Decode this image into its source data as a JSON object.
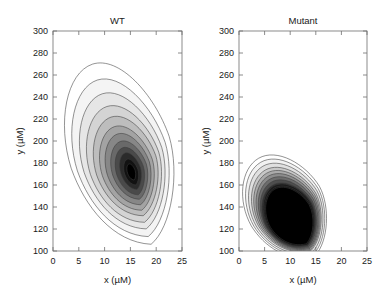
{
  "figure": {
    "background": "#ffffff",
    "width": 387,
    "height": 300
  },
  "chart_data": {
    "type": "contour",
    "title": "",
    "xlabel": "x (µM)",
    "ylabel": "y (µM)",
    "xlim": [
      0,
      25
    ],
    "ylim": [
      100,
      300
    ],
    "xticks": [
      0,
      5,
      10,
      15,
      20,
      25
    ],
    "yticks": [
      100,
      120,
      140,
      160,
      180,
      200,
      220,
      240,
      260,
      280,
      300
    ],
    "grid": false,
    "legend": "none",
    "colormap": "grayscale (white = low density, black = high density)",
    "panels": [
      {
        "name": "WT",
        "title": "WT",
        "description": "Broad nested teardrop-shaped density contours tilted up-right; light outer shells darkening toward a black core.",
        "peak": {
          "x": 15.2,
          "y": 172
        },
        "extent": {
          "x": [
            3.0,
            22.5
          ],
          "y": [
            108,
            276
          ]
        },
        "levels": [
          {
            "index": 1,
            "fill": "#ffffff",
            "label": "outermost"
          },
          {
            "index": 2,
            "fill": "#f2f2f2"
          },
          {
            "index": 3,
            "fill": "#e2e2e2"
          },
          {
            "index": 4,
            "fill": "#cfcfcf"
          },
          {
            "index": 5,
            "fill": "#b8b8b8"
          },
          {
            "index": 6,
            "fill": "#9e9e9e"
          },
          {
            "index": 7,
            "fill": "#828282"
          },
          {
            "index": 8,
            "fill": "#646464"
          },
          {
            "index": 9,
            "fill": "#454545"
          },
          {
            "index": 10,
            "fill": "#282828"
          },
          {
            "index": 11,
            "fill": "#101010"
          },
          {
            "index": 12,
            "fill": "#000000",
            "label": "innermost / peak"
          }
        ],
        "rings": [
          {
            "cx": 13.2,
            "cy": 190,
            "rx": 9.6,
            "ry": 84,
            "rot": -18,
            "fill": "#ffffff"
          },
          {
            "cx": 13.4,
            "cy": 186,
            "rx": 8.6,
            "ry": 73,
            "rot": -18,
            "fill": "#f4f4f4"
          },
          {
            "cx": 13.7,
            "cy": 183,
            "rx": 7.6,
            "ry": 63,
            "rot": -18,
            "fill": "#e6e6e6"
          },
          {
            "cx": 14.0,
            "cy": 180,
            "rx": 6.7,
            "ry": 54,
            "rot": -18,
            "fill": "#d4d4d4"
          },
          {
            "cx": 14.3,
            "cy": 178,
            "rx": 5.8,
            "ry": 46,
            "rot": -18,
            "fill": "#bdbdbd"
          },
          {
            "cx": 14.5,
            "cy": 176,
            "rx": 4.9,
            "ry": 39,
            "rot": -18,
            "fill": "#a3a3a3"
          },
          {
            "cx": 14.7,
            "cy": 175,
            "rx": 4.1,
            "ry": 33,
            "rot": -18,
            "fill": "#878787"
          },
          {
            "cx": 14.9,
            "cy": 174,
            "rx": 3.3,
            "ry": 27,
            "rot": -18,
            "fill": "#696969"
          },
          {
            "cx": 15.0,
            "cy": 173,
            "rx": 2.6,
            "ry": 22,
            "rot": -18,
            "fill": "#4a4a4a"
          },
          {
            "cx": 15.1,
            "cy": 173,
            "rx": 1.9,
            "ry": 17,
            "rot": -18,
            "fill": "#2b2b2b"
          },
          {
            "cx": 15.2,
            "cy": 172,
            "rx": 1.3,
            "ry": 12,
            "rot": -18,
            "fill": "#121212"
          },
          {
            "cx": 15.2,
            "cy": 172,
            "rx": 0.75,
            "ry": 7.5,
            "rot": -18,
            "fill": "#000000"
          }
        ]
      },
      {
        "name": "Mutant",
        "title": "Mutant",
        "description": "Compact, much denser blob concentrated at low x and low y; tightly spaced contours collapse quickly to a large solid black core.",
        "peak": {
          "x": 10.0,
          "y": 132
        },
        "extent": {
          "x": [
            2.2,
            17.0
          ],
          "y": [
            92,
            192
          ]
        },
        "levels": [
          {
            "index": 1,
            "fill": "#ffffff",
            "label": "outermost"
          },
          {
            "index": 2,
            "fill": "#f0f0f0"
          },
          {
            "index": 3,
            "fill": "#dcdcdc"
          },
          {
            "index": 4,
            "fill": "#c2c2c2"
          },
          {
            "index": 5,
            "fill": "#a6a6a6"
          },
          {
            "index": 6,
            "fill": "#878787"
          },
          {
            "index": 7,
            "fill": "#666666"
          },
          {
            "index": 8,
            "fill": "#474747"
          },
          {
            "index": 9,
            "fill": "#2b2b2b"
          },
          {
            "index": 10,
            "fill": "#151515"
          },
          {
            "index": 11,
            "fill": "#060606"
          },
          {
            "index": 12,
            "fill": "#000000",
            "label": "innermost / peak"
          }
        ],
        "rings": [
          {
            "cx": 9.2,
            "cy": 141,
            "rx": 7.4,
            "ry": 50,
            "rot": -30,
            "fill": "#ffffff"
          },
          {
            "cx": 9.3,
            "cy": 140,
            "rx": 7.0,
            "ry": 47,
            "rot": -30,
            "fill": "#f2f2f2"
          },
          {
            "cx": 9.4,
            "cy": 139,
            "rx": 6.6,
            "ry": 44,
            "rot": -30,
            "fill": "#e0e0e0"
          },
          {
            "cx": 9.5,
            "cy": 138,
            "rx": 6.2,
            "ry": 41,
            "rot": -30,
            "fill": "#c8c8c8"
          },
          {
            "cx": 9.6,
            "cy": 137,
            "rx": 5.9,
            "ry": 39,
            "rot": -30,
            "fill": "#ababab"
          },
          {
            "cx": 9.7,
            "cy": 136,
            "rx": 5.6,
            "ry": 37,
            "rot": -30,
            "fill": "#8d8d8d"
          },
          {
            "cx": 9.8,
            "cy": 135,
            "rx": 5.3,
            "ry": 35,
            "rot": -30,
            "fill": "#6d6d6d"
          },
          {
            "cx": 9.85,
            "cy": 134,
            "rx": 5.0,
            "ry": 33,
            "rot": -30,
            "fill": "#4e4e4e"
          },
          {
            "cx": 9.9,
            "cy": 133,
            "rx": 4.8,
            "ry": 31,
            "rot": -30,
            "fill": "#303030"
          },
          {
            "cx": 9.95,
            "cy": 133,
            "rx": 4.6,
            "ry": 30,
            "rot": -30,
            "fill": "#1a1a1a"
          },
          {
            "cx": 10.0,
            "cy": 132,
            "rx": 4.4,
            "ry": 29,
            "rot": -30,
            "fill": "#080808"
          },
          {
            "cx": 10.0,
            "cy": 132,
            "rx": 4.2,
            "ry": 28,
            "rot": -30,
            "fill": "#000000"
          }
        ]
      }
    ]
  }
}
